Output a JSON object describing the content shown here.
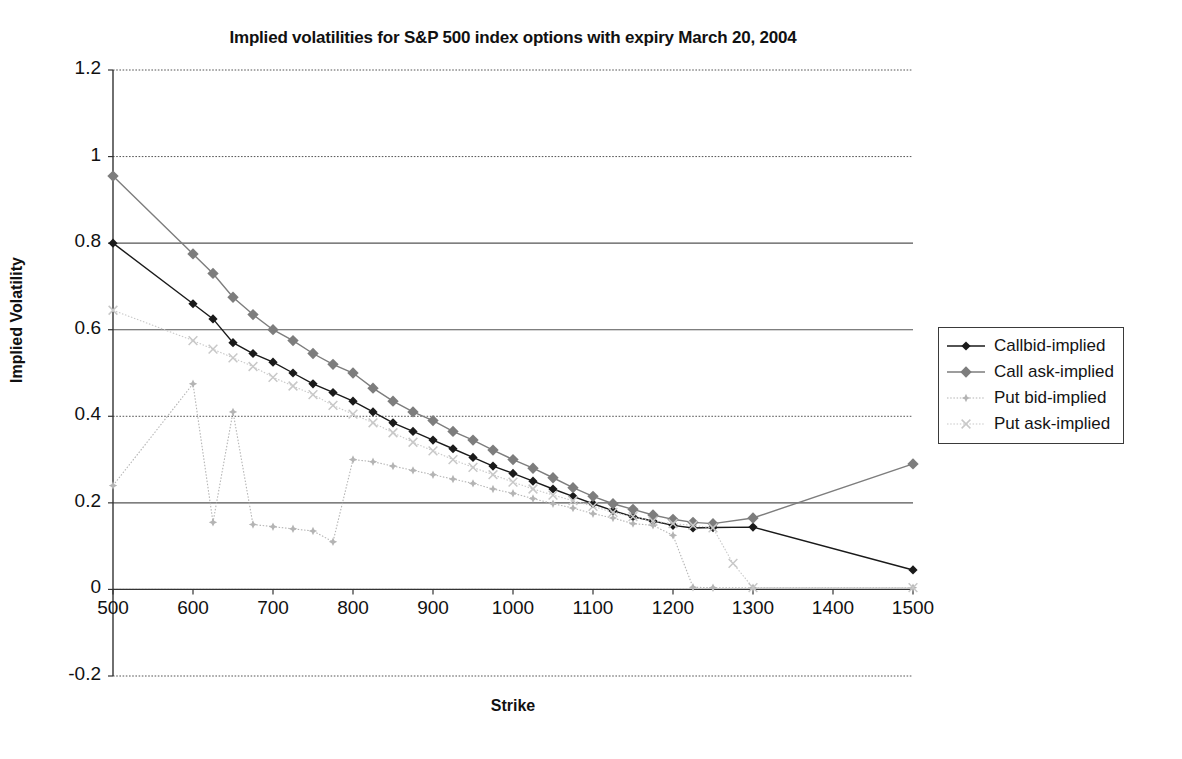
{
  "chart_data": {
    "type": "line",
    "title": "Implied volatilities for S&P 500 index options with expiry March 20, 2004",
    "xlabel": "Strike",
    "ylabel": "Implied Volatility",
    "xlim": [
      500,
      1500
    ],
    "ylim": [
      -0.2,
      1.2
    ],
    "xticks": [
      500,
      600,
      700,
      800,
      900,
      1000,
      1100,
      1200,
      1300,
      1400,
      1500
    ],
    "yticks": [
      -0.2,
      0,
      0.2,
      0.4,
      0.6,
      0.8,
      1,
      1.2
    ],
    "ytick_labels": [
      "-0.2",
      "0",
      "0.2",
      "0.4",
      "0.6",
      "0.8",
      "1",
      "1.2"
    ],
    "xtick_labels": [
      "500",
      "600",
      "700",
      "800",
      "900",
      "1000",
      "1100",
      "1200",
      "1300",
      "1400",
      "1500"
    ],
    "grid": "horizontal",
    "legend_position": "right",
    "series": [
      {
        "name": "Callbid-implied",
        "color": "#1a1a1a",
        "marker": "diamond",
        "linestyle": "solid",
        "x": [
          500,
          600,
          625,
          650,
          675,
          700,
          725,
          750,
          775,
          800,
          825,
          850,
          875,
          900,
          925,
          950,
          975,
          1000,
          1025,
          1050,
          1075,
          1100,
          1125,
          1150,
          1175,
          1200,
          1225,
          1250,
          1300,
          1500
        ],
        "y": [
          0.8,
          0.66,
          0.625,
          0.57,
          0.545,
          0.525,
          0.5,
          0.475,
          0.455,
          0.435,
          0.41,
          0.385,
          0.365,
          0.345,
          0.325,
          0.305,
          0.285,
          0.268,
          0.25,
          0.232,
          0.215,
          0.198,
          0.182,
          0.168,
          0.158,
          0.148,
          0.142,
          0.143,
          0.144,
          0.045
        ]
      },
      {
        "name": "Call ask-implied",
        "color": "#7d7d7d",
        "marker": "square",
        "linestyle": "solid",
        "x": [
          500,
          600,
          625,
          650,
          675,
          700,
          725,
          750,
          775,
          800,
          825,
          850,
          875,
          900,
          925,
          950,
          975,
          1000,
          1025,
          1050,
          1075,
          1100,
          1125,
          1150,
          1175,
          1200,
          1225,
          1250,
          1300,
          1500
        ],
        "y": [
          0.955,
          0.775,
          0.73,
          0.675,
          0.635,
          0.6,
          0.575,
          0.545,
          0.52,
          0.5,
          0.465,
          0.435,
          0.41,
          0.39,
          0.365,
          0.345,
          0.322,
          0.3,
          0.28,
          0.258,
          0.235,
          0.215,
          0.198,
          0.185,
          0.172,
          0.162,
          0.155,
          0.152,
          0.165,
          0.29
        ]
      },
      {
        "name": "Put bid-implied",
        "color": "#b4b4b4",
        "marker": "star",
        "linestyle": "dotted",
        "x": [
          500,
          600,
          625,
          650,
          675,
          700,
          725,
          750,
          775,
          800,
          825,
          850,
          875,
          900,
          925,
          950,
          975,
          1000,
          1025,
          1050,
          1075,
          1100,
          1125,
          1150,
          1175,
          1200,
          1225,
          1250,
          1300,
          1500
        ],
        "y": [
          0.24,
          0.475,
          0.155,
          0.41,
          0.15,
          0.145,
          0.14,
          0.135,
          0.11,
          0.3,
          0.295,
          0.285,
          0.275,
          0.265,
          0.255,
          0.245,
          0.232,
          0.222,
          0.21,
          0.198,
          0.188,
          0.175,
          0.165,
          0.152,
          0.148,
          0.125,
          0.005,
          0.004,
          0.004,
          0.004
        ]
      },
      {
        "name": "Put ask-implied",
        "color": "#c8c8c8",
        "marker": "cross",
        "linestyle": "dotted",
        "x": [
          500,
          600,
          625,
          650,
          675,
          700,
          725,
          750,
          775,
          800,
          825,
          850,
          875,
          900,
          925,
          950,
          975,
          1000,
          1025,
          1050,
          1075,
          1100,
          1125,
          1150,
          1175,
          1200,
          1225,
          1250,
          1275,
          1300,
          1500
        ],
        "y": [
          0.645,
          0.575,
          0.555,
          0.535,
          0.515,
          0.49,
          0.47,
          0.45,
          0.425,
          0.405,
          0.385,
          0.362,
          0.34,
          0.32,
          0.3,
          0.282,
          0.265,
          0.248,
          0.232,
          0.218,
          0.205,
          0.192,
          0.178,
          0.168,
          0.158,
          0.152,
          0.148,
          0.142,
          0.06,
          0.004,
          0.004
        ]
      }
    ]
  },
  "legend": {
    "items": [
      {
        "label": "Callbid-implied"
      },
      {
        "label": "Call ask-implied"
      },
      {
        "label": "Put bid-implied"
      },
      {
        "label": "Put ask-implied"
      }
    ]
  }
}
